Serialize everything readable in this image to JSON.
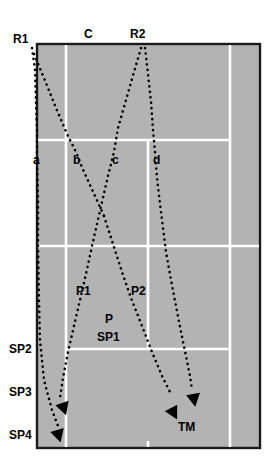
{
  "figure": {
    "type": "diagram",
    "width": 274,
    "height": 469
  },
  "colors": {
    "court_surface": "#b3b3b3",
    "court_lines": "#ffffff",
    "court_border": "#1a1a1a",
    "trajectory": "#000000",
    "label_text": "#000000",
    "page_background": "#ffffff"
  },
  "court": {
    "outer": {
      "x": 37,
      "y": 44,
      "width": 223,
      "height": 404
    },
    "lines": {
      "vertical": [
        {
          "name": "left-singles-sideline",
          "x": 66,
          "y1": 44,
          "y2": 448
        },
        {
          "name": "right-singles-sideline",
          "x": 230,
          "y1": 44,
          "y2": 448
        },
        {
          "name": "center-service-line",
          "x": 148,
          "y1": 140,
          "y2": 349
        }
      ],
      "horizontal": [
        {
          "name": "far-service-line",
          "y": 140,
          "x1": 37,
          "x2": 230
        },
        {
          "name": "net-line",
          "y": 246,
          "x1": 37,
          "x2": 260
        },
        {
          "name": "near-service-line",
          "y": 349,
          "x1": 66,
          "x2": 230
        }
      ],
      "center_mark": {
        "x": 148,
        "y1": 442,
        "y2": 448
      }
    }
  },
  "labels": {
    "top": [
      {
        "id": "R1",
        "text": "R1",
        "x": 13,
        "y": 34
      },
      {
        "id": "C",
        "text": "C",
        "x": 84,
        "y": 30
      },
      {
        "id": "R2",
        "text": "R2",
        "x": 130,
        "y": 30
      }
    ],
    "mid_row": [
      {
        "id": "a",
        "text": "a",
        "x": 33,
        "y": 154
      },
      {
        "id": "b",
        "text": "b",
        "x": 73,
        "y": 154
      },
      {
        "id": "c",
        "text": "c",
        "x": 112,
        "y": 154
      },
      {
        "id": "d",
        "text": "d",
        "x": 153,
        "y": 154
      }
    ],
    "inner": [
      {
        "id": "P1",
        "text": "P1",
        "x": 76,
        "y": 285
      },
      {
        "id": "P2",
        "text": "P2",
        "x": 131,
        "y": 285
      },
      {
        "id": "P",
        "text": "P",
        "x": 105,
        "y": 313
      },
      {
        "id": "SP1",
        "text": "SP1",
        "x": 97,
        "y": 331
      },
      {
        "id": "TM",
        "text": "TM",
        "x": 178,
        "y": 421
      }
    ],
    "left_axis": [
      {
        "id": "SP2",
        "text": "SP2",
        "x": 9,
        "y": 343
      },
      {
        "id": "SP3",
        "text": "SP3",
        "x": 9,
        "y": 386
      },
      {
        "id": "SP4",
        "text": "SP4",
        "x": 9,
        "y": 429
      }
    ]
  },
  "trajectories": [
    {
      "id": "R1-a",
      "from": "R1",
      "to": "a",
      "end": "SP4",
      "style": "dotted",
      "points": "32,48 35,70 36,100 37,130 37,160 38,200 38,246 39,300 40,340 44,380 52,410 58,428"
    },
    {
      "id": "R1-b",
      "from": "R1",
      "to": "b",
      "end": "SP3",
      "style": "dotted",
      "points": "34,54 44,78 56,108 68,136 76,152 84,172 95,196 104,216 112,236 121,262 129,288 138,316 148,344 156,368 160,386 62,400"
    },
    {
      "id": "R2-c",
      "from": "R2",
      "to": "c",
      "end": "SP4",
      "style": "dotted",
      "points": "141,48 134,72 126,100 118,128 114,152 108,176 102,202 97,224 92,246 86,274 80,300 74,326 68,352 63,378 58,400"
    },
    {
      "id": "R2-d",
      "from": "R2",
      "to": "d",
      "end": "TM",
      "style": "dotted",
      "points": "145,48 148,74 151,102 153,130 155,152 157,178 160,204 163,228 166,252 171,280 176,306 181,332 186,356 190,376 193,392"
    },
    {
      "id": "b-P2-TM",
      "from": "b",
      "via": "P2",
      "to": "TM",
      "style": "dotted",
      "points": "104,218 113,244 122,272 131,298 142,326 152,352 162,376 170,394"
    }
  ],
  "arrows": [
    {
      "id": "arrow-SP3-left",
      "x": 61,
      "y": 402,
      "angle": 20,
      "target": "SP3"
    },
    {
      "id": "arrow-SP4-left",
      "x": 57,
      "y": 430,
      "angle": 18,
      "target": "SP4"
    },
    {
      "id": "arrow-TM-upper",
      "x": 194,
      "y": 394,
      "angle": 10,
      "target": "TM"
    },
    {
      "id": "arrow-TM-lower",
      "x": 172,
      "y": 410,
      "angle": 28,
      "target": "TM"
    }
  ]
}
